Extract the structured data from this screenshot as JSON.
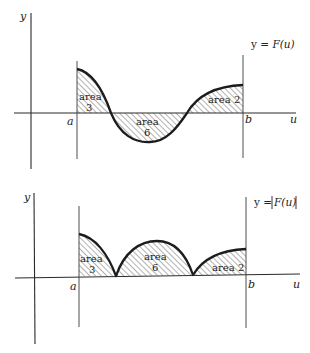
{
  "figures": [
    {
      "id": "top",
      "equation": {
        "prefix": "y = ",
        "func": "F(u)",
        "abs": false
      },
      "axis_labels": {
        "y": "y",
        "x": "u"
      },
      "bounds": {
        "left": "a",
        "right": "b"
      },
      "regions": [
        {
          "word": "area",
          "value": "3",
          "sign": "positive"
        },
        {
          "word": "area",
          "value": "6",
          "sign": "negative"
        },
        {
          "word": "area",
          "value": "2",
          "sign": "positive"
        }
      ]
    },
    {
      "id": "bottom",
      "equation": {
        "prefix": "y = ",
        "func": "F(u)",
        "abs": true
      },
      "axis_labels": {
        "y": "y",
        "x": "u"
      },
      "bounds": {
        "left": "a",
        "right": "b"
      },
      "regions": [
        {
          "word": "area",
          "value": "3",
          "sign": "positive"
        },
        {
          "word": "area",
          "value": "6",
          "sign": "positive"
        },
        {
          "word": "area",
          "value": "2",
          "sign": "positive"
        }
      ]
    }
  ],
  "colors": {
    "ink": "#1c1c1c",
    "hatch": "#555555",
    "background": "#ffffff"
  }
}
